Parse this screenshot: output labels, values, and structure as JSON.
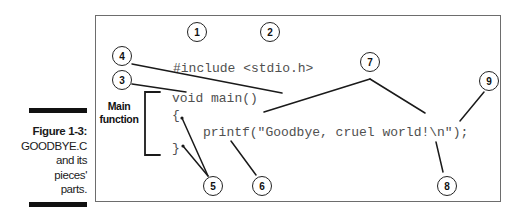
{
  "caption": {
    "title": "Figure 1-3:",
    "lines": [
      "GOODBYE.C",
      "and its",
      "pieces'",
      "parts."
    ]
  },
  "code": {
    "line1": "#include <stdio.h>",
    "line2": "void main()",
    "line3": "{",
    "line4": "printf(\"Goodbye, cruel world!\\n\");",
    "line5": "}"
  },
  "bracket_label": {
    "line1": "Main",
    "line2": "function"
  },
  "callouts": [
    "1",
    "2",
    "3",
    "4",
    "5",
    "6",
    "7",
    "8",
    "9"
  ],
  "colors": {
    "frame": "#6d6d6d",
    "code_text": "#505050",
    "ink": "#111111"
  }
}
